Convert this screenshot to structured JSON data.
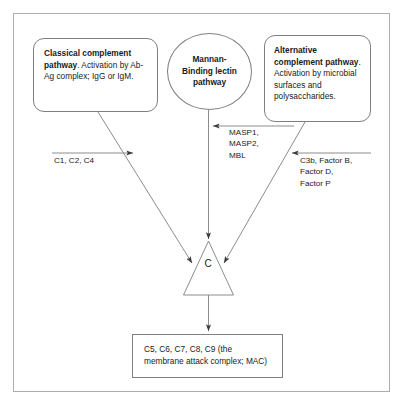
{
  "diagram": {
    "title_visible": false,
    "nodes": {
      "classical": {
        "name": "Classical complement pathway",
        "bold_part": "Classical complement pathway",
        "rest": ". Activation by Ab-Ag complex; IgG or IgM.",
        "full_text": "Classical complement pathway. Activation by Ab-Ag complex; IgG or IgM."
      },
      "lectin": {
        "name": "Mannan-Binding lectin pathway",
        "line1": "Mannan-",
        "line2": "Binding lectin",
        "line3": "pathway",
        "full_text": "Mannan-Binding lectin pathway"
      },
      "alternative": {
        "bold_part": "Alternative complement pathway",
        "rest": ". Activation by microbial surfaces and polysaccharides.",
        "full_text": "Alternative complement pathway. Activation by microbial surfaces and polysaccharides."
      },
      "convergence": {
        "label": "C",
        "shape": "triangle"
      },
      "mac": {
        "full_text": "C5, C6, C7, C8, C9 (the membrane attack complex; MAC)"
      }
    },
    "edge_labels": {
      "classical": "C1, C2, C4",
      "lectin": "MASP1,\nMASP2,\nMBL",
      "alternative": "C3b, Factor B,\nFactor D,\nFactor P"
    },
    "colors": {
      "stroke": "#7f7f7f",
      "arrow": "#595959",
      "text": "#1a1a1a",
      "frame": "#adadad",
      "background": "#ffffff"
    }
  }
}
